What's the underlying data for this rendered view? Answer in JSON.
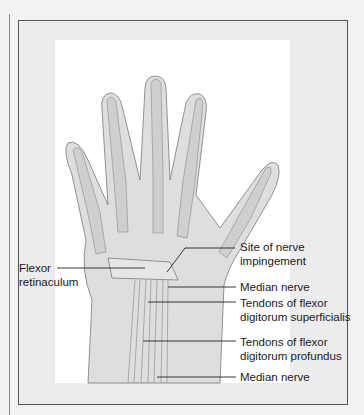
{
  "figure": {
    "labels": [
      {
        "id": "flexor-retinaculum",
        "lines": [
          "Flexor",
          "retinaculum"
        ]
      },
      {
        "id": "site-of-nerve-impingement",
        "lines": [
          "Site of nerve",
          "impingement"
        ]
      },
      {
        "id": "median-nerve-upper",
        "lines": [
          "Median nerve"
        ]
      },
      {
        "id": "tendons-fds",
        "lines": [
          "Tendons of flexor",
          "digitorum superficialis"
        ]
      },
      {
        "id": "tendons-fdp",
        "lines": [
          "Tendons of flexor",
          "digitorum profundus"
        ]
      },
      {
        "id": "median-nerve-lower",
        "lines": [
          "Median nerve"
        ]
      }
    ],
    "colors": {
      "background": "#f2f2f2",
      "frame": "#555555",
      "panel": "#ffffff",
      "skin": "#d9d9d9",
      "bone": "#c8c8c8",
      "outline": "#7a7a7a",
      "leader": "#222222"
    }
  }
}
